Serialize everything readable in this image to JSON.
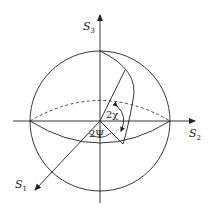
{
  "diagram": {
    "axes": [
      {
        "id": "S1",
        "label": "S",
        "subscript": "1"
      },
      {
        "id": "S2",
        "label": "S",
        "subscript": "2"
      },
      {
        "id": "S3",
        "label": "S",
        "subscript": "3"
      }
    ],
    "angles": [
      {
        "id": "two-chi",
        "label": "2χ"
      },
      {
        "id": "two-psi",
        "label": "2Ψ"
      }
    ],
    "colors": {
      "stroke": "#222222",
      "background": "#ffffff"
    }
  }
}
